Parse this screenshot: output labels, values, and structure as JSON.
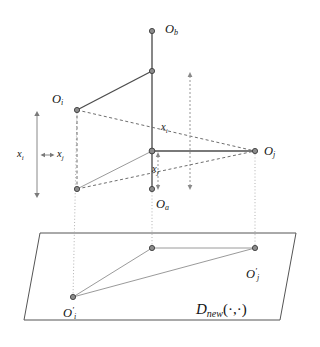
{
  "figure": {
    "name": "3d-projection-diagram",
    "background_color": "#ffffff",
    "line_color_solid": "#4d4d4d",
    "line_color_dashed": "#6e6e6e",
    "line_color_dotted": "#9a9a9a",
    "node_fill": "#8c8c8c",
    "node_stroke": "#3c3c3c",
    "plane_stroke": "#555555"
  },
  "labels": {
    "o_b": {
      "base": "O",
      "sub": "b",
      "x": 168,
      "y": 30
    },
    "o_i": {
      "base": "O",
      "sub": "i",
      "x": 55,
      "y": 100
    },
    "o_j": {
      "base": "O",
      "sub": "j",
      "x": 268,
      "y": 152
    },
    "o_a": {
      "base": "O",
      "sub": "a",
      "x": 161,
      "y": 203
    },
    "o_i_proj": {
      "base": "O",
      "prime": "′",
      "sub": "i",
      "x": 72,
      "y": 314
    },
    "o_j_proj": {
      "base": "O",
      "prime": "′",
      "sub": "j",
      "x": 253,
      "y": 275
    },
    "x_i_left": {
      "base": "x",
      "sub": "i",
      "x": 24,
      "y": 155
    },
    "x_j_left": {
      "base": "x",
      "sub": "j",
      "x": 60,
      "y": 155
    },
    "x_i_mid": {
      "base": "x",
      "sub": "i",
      "x": 165,
      "y": 128
    },
    "x_j_mid": {
      "base": "x",
      "sub": "j",
      "x": 156,
      "y": 170
    },
    "d_new": {
      "base": "D",
      "sub": "new",
      "args": "(·,·)",
      "x": 217,
      "y": 311
    }
  },
  "nodes": [
    {
      "name": "node-o-b",
      "x": 152,
      "y": 31
    },
    {
      "name": "node-top-mid",
      "x": 152,
      "y": 71
    },
    {
      "name": "node-o-i",
      "x": 77,
      "y": 110
    },
    {
      "name": "node-center",
      "x": 152,
      "y": 151
    },
    {
      "name": "node-o-j",
      "x": 255,
      "y": 151
    },
    {
      "name": "node-lower-left",
      "x": 77,
      "y": 189
    },
    {
      "name": "node-o-a",
      "x": 152,
      "y": 189
    },
    {
      "name": "node-plane-mid",
      "x": 152,
      "y": 248
    },
    {
      "name": "node-plane-j",
      "x": 255,
      "y": 248
    },
    {
      "name": "node-plane-i",
      "x": 73,
      "y": 297
    }
  ],
  "plane": {
    "name": "projection-plane",
    "points": "40,233 296,233 280,320 24,320"
  },
  "arrows": {
    "x_i_vertical": {
      "x": 37,
      "y_top": 113,
      "y_bottom": 196
    },
    "x_j_horizontal": {
      "y": 155,
      "x_left": 44,
      "x_right": 54
    },
    "x_i_mid_vertical": {
      "x": 190,
      "y_top": 72,
      "y_bottom": 190
    },
    "x_j_mid_vertical": {
      "x": 158,
      "y_top": 153,
      "y_bottom": 189
    }
  }
}
